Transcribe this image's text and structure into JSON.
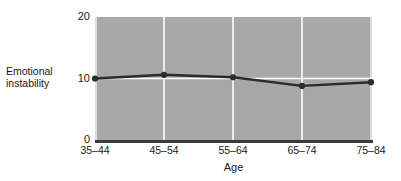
{
  "chart_data": {
    "type": "line",
    "title": "",
    "xlabel": "Age",
    "ylabel": "Emotional instability",
    "categories": [
      "35–44",
      "45–54",
      "55–64",
      "65–74",
      "75–84"
    ],
    "values": [
      10.0,
      10.6,
      10.2,
      8.8,
      9.4
    ],
    "series": [
      {
        "name": "Emotional instability",
        "values": [
          10.0,
          10.6,
          10.2,
          8.8,
          9.4
        ]
      }
    ],
    "ylim": [
      0,
      20
    ],
    "yticks": [
      0,
      10,
      20
    ],
    "ytick_labels": [
      "0",
      "10",
      "20"
    ],
    "grid": "white gridlines: vertical at each category, horizontal at y=10",
    "legend": "none",
    "marker": "filled circle",
    "line_color": "#2b2b2b",
    "marker_color": "#2b2b2b",
    "plot_background": "#a8a8a8",
    "gridline_color": "#ffffff",
    "axis_color": "#3a3a3a",
    "figure_background": "#ffffff"
  },
  "axes": {
    "y_title_line1": "Emotional",
    "y_title_line2": "instability",
    "x_title": "Age"
  }
}
